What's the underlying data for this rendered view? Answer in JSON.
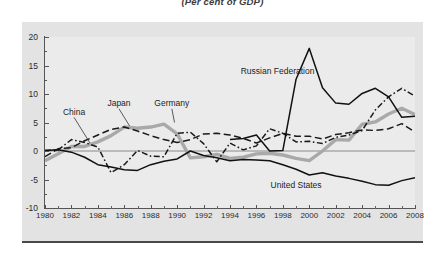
{
  "chart_data": {
    "type": "line",
    "title": "(Per cent of GDP)",
    "xlabel": "",
    "ylabel": "",
    "xlim": [
      1980,
      2008
    ],
    "ylim": [
      -10,
      20
    ],
    "yticks": [
      20,
      15,
      10,
      5,
      0,
      -5,
      -10
    ],
    "xticks": [
      1980,
      1982,
      1984,
      1986,
      1988,
      1990,
      1992,
      1994,
      1996,
      1998,
      2000,
      2002,
      2004,
      2006,
      2008
    ],
    "grid": false,
    "zero_line": true,
    "legend_position": "inline-annotations",
    "x": [
      1980,
      1981,
      1982,
      1983,
      1984,
      1985,
      1986,
      1987,
      1988,
      1989,
      1990,
      1991,
      1992,
      1993,
      1994,
      1995,
      1996,
      1997,
      1998,
      1999,
      2000,
      2001,
      2002,
      2003,
      2004,
      2005,
      2006,
      2007,
      2008
    ],
    "series": [
      {
        "name": "China",
        "style": "dash-dot",
        "color": "#1a1a1a",
        "label_x": 1982.2,
        "label_y": 6.6,
        "values": [
          0.1,
          0.2,
          2.0,
          1.5,
          0.7,
          -3.8,
          -2.4,
          0.1,
          -0.9,
          -1.0,
          3.1,
          3.3,
          1.3,
          -1.9,
          1.4,
          0.2,
          0.9,
          3.9,
          3.1,
          1.6,
          1.7,
          1.3,
          2.4,
          2.8,
          3.6,
          7.2,
          9.5,
          11.0,
          9.6
        ]
      },
      {
        "name": "Japan",
        "style": "long-dash",
        "color": "#1a1a1a",
        "label_x": 1985.6,
        "label_y": 8.2,
        "values": [
          -1.0,
          0.4,
          0.6,
          1.8,
          2.8,
          3.8,
          4.2,
          3.5,
          2.7,
          2.0,
          1.5,
          2.0,
          3.0,
          3.1,
          2.8,
          2.2,
          1.4,
          2.3,
          3.1,
          2.6,
          2.6,
          2.1,
          2.9,
          3.2,
          3.7,
          3.6,
          3.9,
          4.8,
          3.3
        ]
      },
      {
        "name": "Germany",
        "style": "solid-thick-gray",
        "color": "#a9a9a9",
        "label_x": 1989.6,
        "label_y": 8.2,
        "values": [
          -1.7,
          -0.5,
          0.8,
          0.8,
          1.6,
          2.7,
          4.2,
          4.0,
          4.2,
          4.7,
          3.0,
          -1.2,
          -1.0,
          -0.6,
          -1.3,
          -1.1,
          -0.5,
          -0.4,
          -0.7,
          -1.3,
          -1.7,
          0.0,
          2.0,
          1.9,
          4.7,
          5.1,
          6.5,
          7.5,
          6.4
        ]
      },
      {
        "name": "Russian Federation",
        "style": "solid",
        "color": "#111111",
        "label_x": 1997.6,
        "label_y": 13.8,
        "values": [
          null,
          null,
          null,
          null,
          null,
          null,
          null,
          null,
          null,
          null,
          null,
          null,
          null,
          null,
          2.0,
          2.2,
          2.8,
          0.0,
          0.1,
          12.6,
          18.0,
          11.1,
          8.4,
          8.2,
          10.1,
          11.0,
          9.5,
          5.9,
          6.1
        ]
      },
      {
        "name": "United States",
        "style": "solid",
        "color": "#111111",
        "label_x": 1999.0,
        "label_y": -6.2,
        "values": [
          0.1,
          0.2,
          -0.2,
          -1.1,
          -2.4,
          -2.8,
          -3.3,
          -3.4,
          -2.4,
          -1.8,
          -1.4,
          0.0,
          -0.8,
          -1.2,
          -1.7,
          -1.5,
          -1.6,
          -1.7,
          -2.4,
          -3.2,
          -4.2,
          -3.8,
          -4.4,
          -4.8,
          -5.3,
          -5.9,
          -6.0,
          -5.2,
          -4.7
        ]
      }
    ]
  }
}
